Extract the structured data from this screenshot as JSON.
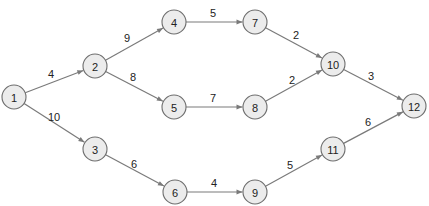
{
  "diagram": {
    "type": "directed-network",
    "colors": {
      "node_fill": "#ececec",
      "node_stroke": "#6e6e6e",
      "edge": "#7a7a7a",
      "text": "#222222"
    },
    "nodes": [
      {
        "id": "1",
        "label": "1",
        "x": 14,
        "y": 97
      },
      {
        "id": "2",
        "label": "2",
        "x": 95,
        "y": 66
      },
      {
        "id": "3",
        "label": "3",
        "x": 95,
        "y": 149
      },
      {
        "id": "4",
        "label": "4",
        "x": 174,
        "y": 22
      },
      {
        "id": "5",
        "label": "5",
        "x": 174,
        "y": 107
      },
      {
        "id": "6",
        "label": "6",
        "x": 175,
        "y": 192
      },
      {
        "id": "7",
        "label": "7",
        "x": 255,
        "y": 22
      },
      {
        "id": "8",
        "label": "8",
        "x": 255,
        "y": 107
      },
      {
        "id": "9",
        "label": "9",
        "x": 255,
        "y": 192
      },
      {
        "id": "10",
        "label": "10",
        "x": 333,
        "y": 64
      },
      {
        "id": "11",
        "label": "11",
        "x": 333,
        "y": 149
      },
      {
        "id": "12",
        "label": "12",
        "x": 414,
        "y": 106
      }
    ],
    "edges": [
      {
        "from": "1",
        "to": "2",
        "weight": "4",
        "lx": 51,
        "ly": 74
      },
      {
        "from": "1",
        "to": "3",
        "weight": "10",
        "lx": 54,
        "ly": 117
      },
      {
        "from": "2",
        "to": "4",
        "weight": "9",
        "lx": 127,
        "ly": 38
      },
      {
        "from": "2",
        "to": "5",
        "weight": "8",
        "lx": 133,
        "ly": 77
      },
      {
        "from": "3",
        "to": "6",
        "weight": "6",
        "lx": 134,
        "ly": 164
      },
      {
        "from": "4",
        "to": "7",
        "weight": "5",
        "lx": 213,
        "ly": 13
      },
      {
        "from": "5",
        "to": "8",
        "weight": "7",
        "lx": 213,
        "ly": 98
      },
      {
        "from": "6",
        "to": "9",
        "weight": "4",
        "lx": 214,
        "ly": 183
      },
      {
        "from": "7",
        "to": "10",
        "weight": "2",
        "lx": 296,
        "ly": 35
      },
      {
        "from": "8",
        "to": "10",
        "weight": "2",
        "lx": 292,
        "ly": 80
      },
      {
        "from": "10",
        "to": "12",
        "weight": "3",
        "lx": 371,
        "ly": 76
      },
      {
        "from": "9",
        "to": "11",
        "weight": "5",
        "lx": 290,
        "ly": 165
      },
      {
        "from": "11",
        "to": "12",
        "weight": "6",
        "lx": 368,
        "ly": 122
      }
    ]
  }
}
